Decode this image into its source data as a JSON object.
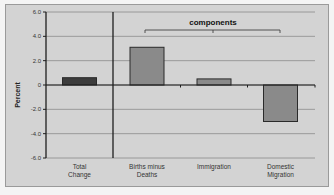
{
  "chart_data": {
    "type": "bar",
    "title": "",
    "xlabel": "",
    "ylabel": "Percent",
    "ylim": [
      -6.0,
      6.0
    ],
    "yticks": [
      "6.0",
      "4.0",
      "2.0",
      "0",
      "-2.0",
      "-4.0",
      "-6.0"
    ],
    "grid": true,
    "legend": null,
    "categories": [
      "Total Change",
      "Births minus Deaths",
      "Immigration",
      "Domestic Migration"
    ],
    "category_lines": [
      [
        "Total",
        "Change"
      ],
      [
        "Births minus",
        "Deaths"
      ],
      [
        "Immigration"
      ],
      [
        "Domestic",
        "Migration"
      ]
    ],
    "values": [
      0.6,
      3.1,
      0.5,
      -3.0
    ],
    "annotations": [
      {
        "text": "components",
        "spans": [
          "Births minus Deaths",
          "Immigration",
          "Domestic Migration"
        ]
      }
    ]
  },
  "colors": {
    "background": "#d3d3d3",
    "total_bar": "#3c3c3c",
    "component_bar": "#8a8a8a",
    "bar_border": "#2a2a2a",
    "grid": "#8c8c8c",
    "axis": "#1e1e1e"
  }
}
